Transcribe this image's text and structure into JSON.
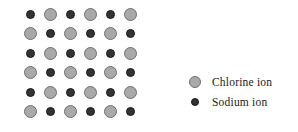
{
  "figure": {
    "type": "diagram"
  },
  "lattice": {
    "rows": 6,
    "columns": 6,
    "origin_x": 30,
    "origin_y": 14,
    "spacing_x": 20,
    "spacing_y": 19.5,
    "pattern_note": "checkerboard: odd rows begin with sodium ion, even rows begin with chlorine ion",
    "grid": [
      [
        "sodium",
        "chlorine",
        "sodium",
        "chlorine",
        "sodium",
        "chlorine"
      ],
      [
        "chlorine",
        "sodium",
        "chlorine",
        "sodium",
        "chlorine",
        "sodium"
      ],
      [
        "sodium",
        "chlorine",
        "sodium",
        "chlorine",
        "sodium",
        "chlorine"
      ],
      [
        "chlorine",
        "sodium",
        "chlorine",
        "sodium",
        "chlorine",
        "sodium"
      ],
      [
        "sodium",
        "chlorine",
        "sodium",
        "chlorine",
        "sodium",
        "chlorine"
      ],
      [
        "chlorine",
        "sodium",
        "chlorine",
        "sodium",
        "chlorine",
        "sodium"
      ]
    ]
  },
  "legend": {
    "items": [
      {
        "key": "chlorine",
        "label": "Chlorine ion",
        "icon": "chlorine-ion-circle",
        "color": "#a9a9a9",
        "outline": "#6f6f6f",
        "size_px": 12
      },
      {
        "key": "sodium",
        "label": "Sodium ion",
        "icon": "sodium-ion-circle",
        "color": "#333333",
        "outline": "#1a1a1a",
        "size_px": 8
      }
    ]
  },
  "colors": {
    "background": "#ffffff",
    "chlorine": "#a9a9a9",
    "sodium": "#333333",
    "text": "#1a1a1a"
  }
}
